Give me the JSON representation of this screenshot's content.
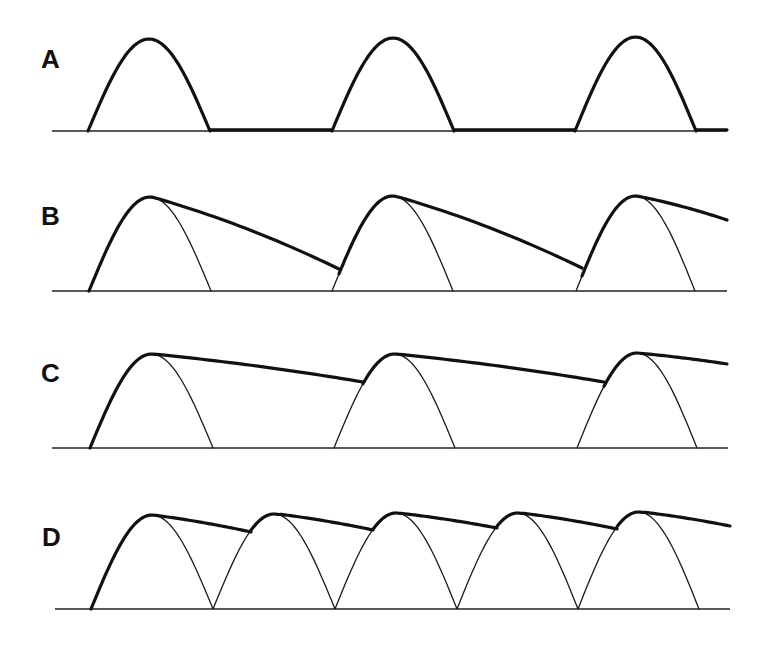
{
  "chart_data": {
    "type": "line",
    "title": "",
    "xlabel": "",
    "ylabel": "",
    "grid": false,
    "legend": null,
    "panels": [
      {
        "label": "A",
        "baseline_y": 131,
        "baseline_x": [
          52,
          727
        ],
        "arches": [
          {
            "x0": 88,
            "x1": 210,
            "peak_y": 39
          },
          {
            "x0": 332,
            "x1": 454,
            "peak_y": 38
          },
          {
            "x0": 575,
            "x1": 696,
            "peak_y": 37
          }
        ],
        "thick_arches": true,
        "thick_flat_segments": [
          [
            210,
            332
          ],
          [
            454,
            575
          ],
          [
            696,
            727
          ]
        ],
        "envelope": []
      },
      {
        "label": "B",
        "baseline_y": 291,
        "baseline_x": [
          52,
          727
        ],
        "arches": [
          {
            "x0": 89,
            "x1": 211,
            "peak_y": 197
          },
          {
            "x0": 332,
            "x1": 453,
            "peak_y": 196
          },
          {
            "x0": 576,
            "x1": 695,
            "peak_y": 196
          }
        ],
        "thick_arches": false,
        "envelope": [
          {
            "rise_from": 89,
            "peak_x": 152,
            "peak_y": 197,
            "decay_to": [
              339,
              269
            ]
          },
          {
            "rise_from": 339,
            "peak_x": 395,
            "peak_y": 196,
            "decay_to": [
              582,
              268
            ]
          },
          {
            "rise_from": 582,
            "peak_x": 637,
            "peak_y": 196,
            "decay_to": [
              727,
              220
            ]
          }
        ]
      },
      {
        "label": "C",
        "baseline_y": 448,
        "baseline_x": [
          52,
          728
        ],
        "arches": [
          {
            "x0": 90,
            "x1": 213,
            "peak_y": 354
          },
          {
            "x0": 334,
            "x1": 455,
            "peak_y": 354
          },
          {
            "x0": 577,
            "x1": 697,
            "peak_y": 353
          }
        ],
        "thick_arches": false,
        "envelope": [
          {
            "rise_from": 90,
            "peak_x": 153,
            "peak_y": 354,
            "decay_to": [
              363,
              382
            ]
          },
          {
            "rise_from": 363,
            "peak_x": 396,
            "peak_y": 354,
            "decay_to": [
              604,
              382
            ]
          },
          {
            "rise_from": 604,
            "peak_x": 637,
            "peak_y": 353,
            "decay_to": [
              727,
              364
            ]
          }
        ]
      },
      {
        "label": "D",
        "baseline_y": 609,
        "baseline_x": [
          55,
          730
        ],
        "arches": [
          {
            "x0": 91,
            "x1": 213,
            "peak_y": 515
          },
          {
            "x0": 213,
            "x1": 335,
            "peak_y": 514
          },
          {
            "x0": 335,
            "x1": 457,
            "peak_y": 513
          },
          {
            "x0": 457,
            "x1": 578,
            "peak_y": 513
          },
          {
            "x0": 578,
            "x1": 699,
            "peak_y": 512
          }
        ],
        "thick_arches": false,
        "envelope": [
          {
            "rise_from": 91,
            "peak_x": 153,
            "peak_y": 515,
            "decay_to": [
              251,
              532
            ]
          },
          {
            "rise_from": 251,
            "peak_x": 278,
            "peak_y": 514,
            "decay_to": [
              373,
              530
            ]
          },
          {
            "rise_from": 373,
            "peak_x": 398,
            "peak_y": 513,
            "decay_to": [
              497,
              528
            ]
          },
          {
            "rise_from": 497,
            "peak_x": 521,
            "peak_y": 513,
            "decay_to": [
              617,
              529
            ]
          },
          {
            "rise_from": 617,
            "peak_x": 642,
            "peak_y": 512,
            "decay_to": [
              730,
              526
            ]
          }
        ]
      }
    ]
  },
  "labels": {
    "panel_a": "A",
    "panel_b": "B",
    "panel_c": "C",
    "panel_d": "D"
  }
}
